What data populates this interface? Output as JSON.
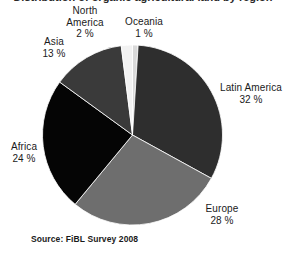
{
  "figure": {
    "title_fragment": "Distribution of organic agricultural land by region",
    "source_note": "Source: FiBL Survey 2008",
    "background_color": "#ffffff",
    "text_color": "#1a1a1a"
  },
  "chart_data": {
    "type": "pie",
    "title": "",
    "xlabel": "",
    "ylabel": "",
    "unit": "%",
    "total": 100,
    "legend": "none",
    "labels_position": "outside",
    "start_angle_deg": 0,
    "direction": "clockwise",
    "categories": [
      "Oceania",
      "Latin America",
      "Europe",
      "Africa",
      "Asia",
      "North America"
    ],
    "values": [
      1,
      32,
      28,
      24,
      13,
      2
    ],
    "colors": [
      "#d9d9d9",
      "#2e2e2e",
      "#6e6e6e",
      "#050505",
      "#3a3a3a",
      "#f2f2f2"
    ],
    "slices": [
      {
        "name": "Oceania",
        "value": 1,
        "label": "Oceania",
        "percent_text": "1 %",
        "color": "#d9d9d9",
        "start_angle_deg": 0,
        "end_angle_deg": 3.6
      },
      {
        "name": "Latin America",
        "value": 32,
        "label": "Latin America",
        "percent_text": "32 %",
        "color": "#2e2e2e",
        "start_angle_deg": 3.6,
        "end_angle_deg": 118.8
      },
      {
        "name": "Europe",
        "value": 28,
        "label": "Europe",
        "percent_text": "28 %",
        "color": "#6e6e6e",
        "start_angle_deg": 118.8,
        "end_angle_deg": 219.6
      },
      {
        "name": "Africa",
        "value": 24,
        "label": "Africa",
        "percent_text": "24 %",
        "color": "#050505",
        "start_angle_deg": 219.6,
        "end_angle_deg": 306.0
      },
      {
        "name": "Asia",
        "value": 13,
        "label": "Asia",
        "percent_text": "13 %",
        "color": "#3a3a3a",
        "start_angle_deg": 306.0,
        "end_angle_deg": 352.8
      },
      {
        "name": "North America",
        "value": 2,
        "label": "North America",
        "percent_text": "2 %",
        "color": "#f2f2f2",
        "start_angle_deg": 352.8,
        "end_angle_deg": 360.0
      }
    ]
  },
  "labels": {
    "north_america": {
      "name_line1": "North",
      "name_line2": "America",
      "percent": "2 %"
    },
    "oceania": {
      "name": "Oceania",
      "percent": "1 %"
    },
    "asia": {
      "name": "Asia",
      "percent": "13 %"
    },
    "latin_america": {
      "name": "Latin America",
      "percent": "32 %"
    },
    "africa": {
      "name": "Africa",
      "percent": "24 %"
    },
    "europe": {
      "name": "Europe",
      "percent": "28 %"
    }
  }
}
